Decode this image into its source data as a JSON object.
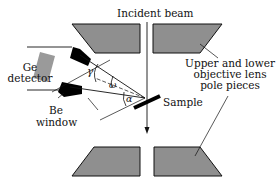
{
  "labels": {
    "incident_beam": "Incident beam",
    "ge_detector_1": "Ge",
    "ge_detector_2": "detector",
    "be_window_1": "Be",
    "be_window_2": "window",
    "sample": "Sample",
    "pole_pieces_1": "Upper and lower",
    "pole_pieces_2": "objective lens",
    "pole_pieces_3": "pole pieces"
  },
  "angles": {
    "gamma": "γ",
    "omega": "ω",
    "alpha": "α"
  },
  "colors": {
    "pole_piece_fill": "#8f8f8f",
    "detector_fill": "#9a9a9a",
    "collimator_fill": "#000000",
    "line": "#111111"
  }
}
